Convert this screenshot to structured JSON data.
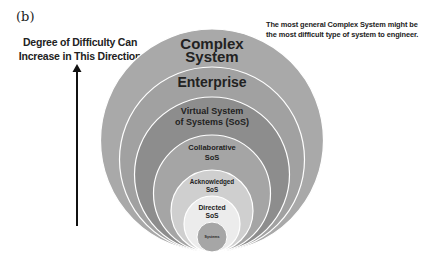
{
  "panel_label": "(b)",
  "axis": {
    "line1": "Degree of Difficulty Can",
    "line2": "Increase in This Direction",
    "arrow_icon": "up-arrow"
  },
  "note": {
    "line1": "The most general Complex System might be",
    "line2": "the most difficult type of system to engineer."
  },
  "rings": [
    {
      "id": "complex",
      "label_lines": [
        "Complex",
        "System"
      ],
      "color": "#a9a9a9"
    },
    {
      "id": "enterprise",
      "label_lines": [
        "Enterprise"
      ],
      "color": "#a1a1a1"
    },
    {
      "id": "virtual",
      "label_lines": [
        "Virtual System",
        "of Systems (SoS)"
      ],
      "color": "#8d8d8d"
    },
    {
      "id": "collaborative",
      "label_lines": [
        "Collaborative",
        "SoS"
      ],
      "color": "#a5a5a5"
    },
    {
      "id": "acknowledged",
      "label_lines": [
        "Acknowledged",
        "SoS"
      ],
      "color": "#cfcfcf"
    },
    {
      "id": "directed",
      "label_lines": [
        "Directed",
        "SoS"
      ],
      "color": "#ececec"
    },
    {
      "id": "systems",
      "label_lines": [
        "Systems"
      ],
      "color": "#a6a6a6"
    }
  ],
  "stroke_color": "#ffffff"
}
